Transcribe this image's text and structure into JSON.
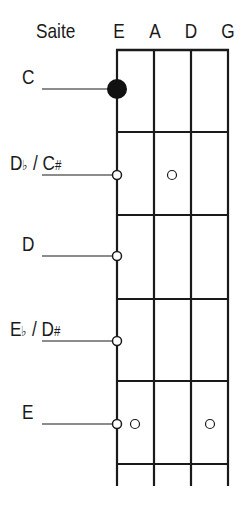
{
  "header": {
    "label": "Saite",
    "strings": [
      "E",
      "A",
      "D",
      "G"
    ]
  },
  "notes": [
    {
      "name": "C",
      "y": 89,
      "marker": "filled"
    },
    {
      "name": "Db / C#",
      "y": 175,
      "marker": "open"
    },
    {
      "name": "D",
      "y": 256,
      "marker": "open"
    },
    {
      "name": "Eb / D#",
      "y": 341,
      "marker": "open"
    },
    {
      "name": "E",
      "y": 424,
      "marker": "open"
    }
  ],
  "labels": {
    "c": "C",
    "db_a": "D",
    "db_flat": "♭",
    "db_sep": " / ",
    "db_b": "C",
    "db_sharp": "#",
    "d": "D",
    "eb_a": "E",
    "eb_flat": "♭",
    "eb_sep": " / ",
    "eb_b": "D",
    "eb_sharp": "#",
    "e": "E"
  },
  "reference_dots": [
    {
      "row": "Db / C#",
      "x": 172
    },
    {
      "row": "E",
      "x": 135
    },
    {
      "row": "E",
      "x": 210
    }
  ],
  "colors": {
    "line": "#1a1a1a",
    "background": "#ffffff"
  }
}
